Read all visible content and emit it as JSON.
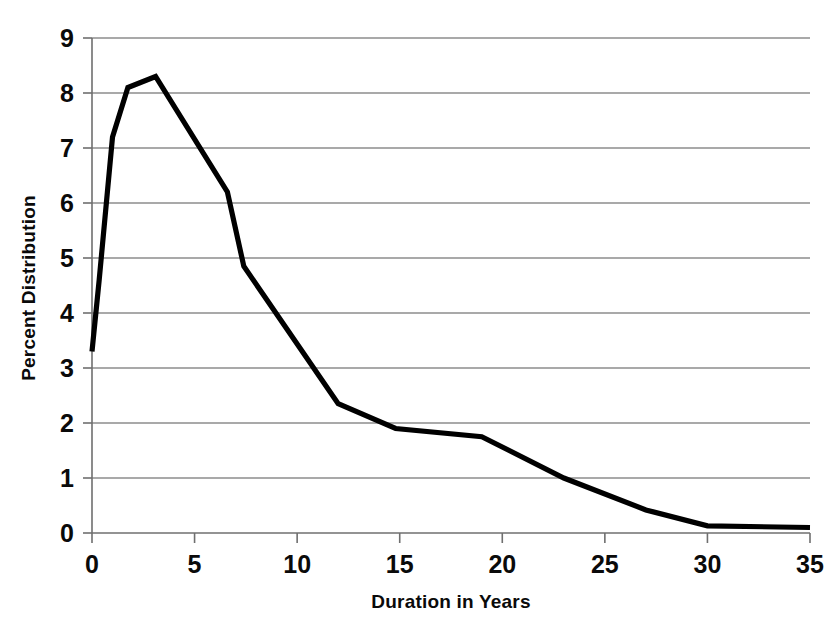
{
  "chart_data": {
    "type": "line",
    "title": "",
    "xlabel": "Duration in Years",
    "ylabel": "Percent Distribution",
    "xlim": [
      0,
      35
    ],
    "ylim": [
      0,
      9
    ],
    "grid": true,
    "gridlines": "horizontal",
    "legend": "none",
    "line_color": "#000000",
    "xticks": [
      0,
      5,
      10,
      15,
      20,
      25,
      30,
      35
    ],
    "xtick_labels": [
      "0",
      "5",
      "10",
      "15",
      "20",
      "25",
      "30",
      "35"
    ],
    "yticks": [
      0,
      1,
      2,
      3,
      4,
      5,
      6,
      7,
      8,
      9
    ],
    "ytick_labels": [
      "0",
      "1",
      "2",
      "3",
      "4",
      "5",
      "6",
      "7",
      "8",
      "9"
    ],
    "series": [
      {
        "name": "Percent Distribution",
        "points": [
          [
            0.0,
            3.3
          ],
          [
            0.35,
            4.6
          ],
          [
            1.0,
            7.2
          ],
          [
            1.75,
            8.1
          ],
          [
            3.1,
            8.3
          ],
          [
            6.6,
            6.2
          ],
          [
            7.4,
            4.85
          ],
          [
            12.0,
            2.35
          ],
          [
            14.8,
            1.9
          ],
          [
            19.0,
            1.75
          ],
          [
            23.0,
            1.0
          ],
          [
            27.0,
            0.42
          ],
          [
            30.0,
            0.13
          ],
          [
            35.0,
            0.1
          ]
        ]
      }
    ]
  },
  "axes": {
    "x_title": "Duration in Years",
    "y_title": "Percent Distribution"
  }
}
